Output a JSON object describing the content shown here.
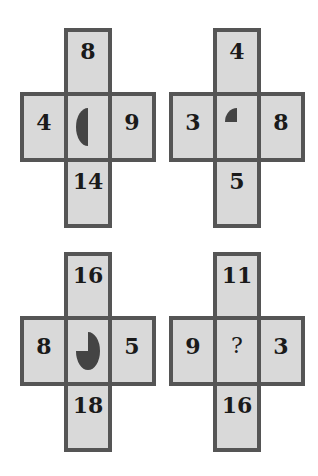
{
  "puzzle": {
    "crosses": [
      {
        "top": "8",
        "left": "4",
        "right": "9",
        "bottom": "14",
        "center": "half-circle-left"
      },
      {
        "top": "4",
        "left": "3",
        "right": "8",
        "bottom": "5",
        "center": "quarter-circle-top-left"
      },
      {
        "top": "16",
        "left": "8",
        "right": "5",
        "bottom": "18",
        "center": "three-quarter-circle"
      },
      {
        "top": "11",
        "left": "9",
        "right": "3",
        "bottom": "16",
        "center": "?"
      }
    ],
    "colors": {
      "cell_fill": "#d9d9d9",
      "border": "#555555",
      "shape": "#444444"
    }
  }
}
